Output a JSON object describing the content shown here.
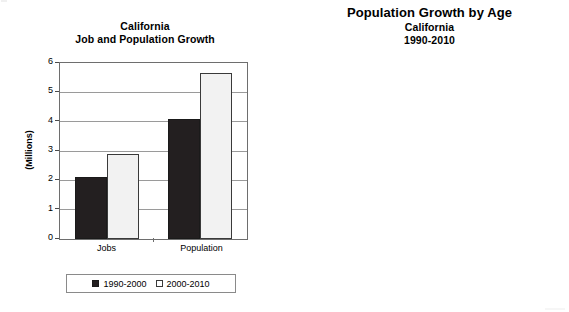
{
  "figures": {
    "left": {
      "titles": {
        "line1": "California",
        "line2": "Job and Population Growth"
      },
      "y_axis_title": "(Millions)",
      "y_ticks": [
        "6",
        "5",
        "4",
        "3",
        "2",
        "1",
        "0"
      ],
      "categories": [
        "Jobs",
        "Population"
      ],
      "legend": [
        {
          "label": "1990-2000",
          "swatch": "filled-square-icon"
        },
        {
          "label": "2000-2010",
          "swatch": "open-square-icon"
        }
      ]
    },
    "right": {
      "titles": {
        "line1": "Population Growth by Age",
        "line2": "California",
        "line3": "1990-2010"
      },
      "y_axis_title": "(Thousands)",
      "y_ticks": [
        "2,000",
        "1,600",
        "1,200",
        "800",
        "400",
        "0",
        "-400",
        "-800",
        "-1,200",
        "-1,600"
      ],
      "categories": [
        "0-19",
        "20-34",
        "35-44",
        "45-54",
        "55-64",
        "65+"
      ],
      "legend": [
        {
          "label": "1990-2000",
          "swatch": "open-square-icon"
        },
        {
          "label": "2000-2010",
          "swatch": "filled-square-icon"
        }
      ]
    }
  },
  "chart_data": [
    {
      "type": "bar",
      "title": "California Job and Population Growth",
      "xlabel": "",
      "ylabel": "(Millions)",
      "ylim": [
        0,
        6
      ],
      "ytick_step": 1,
      "grid": true,
      "legend_position": "bottom",
      "categories": [
        "Jobs",
        "Population"
      ],
      "series": [
        {
          "name": "1990-2000",
          "color": "#231f20",
          "values": [
            2.1,
            4.1
          ]
        },
        {
          "name": "2000-2010",
          "color": "#f2f2f2",
          "values": [
            2.9,
            5.67
          ]
        }
      ]
    },
    {
      "type": "bar",
      "title": "Population Growth by Age / California / 1990-2010",
      "xlabel": "",
      "ylabel": "(Thousands)",
      "ylim": [
        -1600,
        2000
      ],
      "ytick_step": 400,
      "grid": true,
      "legend_position": "bottom",
      "categories": [
        "0-19",
        "20-34",
        "35-44",
        "45-54",
        "55-64",
        "65+"
      ],
      "series": [
        {
          "name": "1990-2000",
          "color": "#d9d9d9",
          "values": [
            1540,
            -530,
            720,
            1510,
            470,
            420
          ]
        },
        {
          "name": "2000-2010",
          "color": "#231f20",
          "values": [
            1000,
            920,
            120,
            1100,
            1700,
            790
          ]
        }
      ]
    }
  ]
}
